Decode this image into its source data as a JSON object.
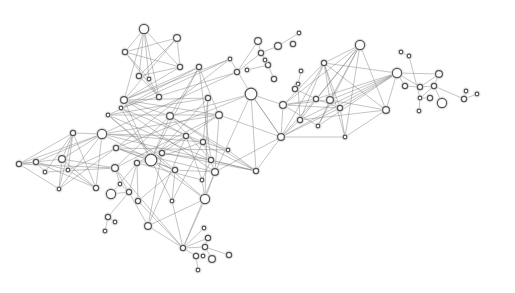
{
  "graph": {
    "type": "network",
    "colors": {
      "edge": "#7a7a7a",
      "node_fill": "#ffffff",
      "node_stroke": "#555555",
      "halo": "#d8d8d8"
    },
    "nodes": [
      {
        "id": "n1",
        "x": 144,
        "y": 29,
        "size": "large"
      },
      {
        "id": "n2",
        "x": 177,
        "y": 38,
        "size": "medium"
      },
      {
        "id": "n3",
        "x": 125,
        "y": 52,
        "size": "small"
      },
      {
        "id": "n4",
        "x": 180,
        "y": 67,
        "size": "small"
      },
      {
        "id": "n5",
        "x": 139,
        "y": 76,
        "size": "small"
      },
      {
        "id": "n6",
        "x": 149,
        "y": 79,
        "size": "tiny"
      },
      {
        "id": "n7",
        "x": 159,
        "y": 97,
        "size": "small"
      },
      {
        "id": "n8",
        "x": 124,
        "y": 100,
        "size": "medium"
      },
      {
        "id": "n9",
        "x": 199,
        "y": 67,
        "size": "small"
      },
      {
        "id": "n10",
        "x": 230,
        "y": 59,
        "size": "tiny"
      },
      {
        "id": "n11",
        "x": 237,
        "y": 72,
        "size": "small"
      },
      {
        "id": "n12",
        "x": 251,
        "y": 94,
        "size": "xlarge"
      },
      {
        "id": "n13",
        "x": 208,
        "y": 98,
        "size": "small"
      },
      {
        "id": "n14",
        "x": 170,
        "y": 116,
        "size": "medium"
      },
      {
        "id": "n15",
        "x": 219,
        "y": 115,
        "size": "medium"
      },
      {
        "id": "n16",
        "x": 121,
        "y": 108,
        "size": "tiny"
      },
      {
        "id": "n17",
        "x": 108,
        "y": 115,
        "size": "tiny"
      },
      {
        "id": "n18",
        "x": 102,
        "y": 134,
        "size": "large"
      },
      {
        "id": "n19",
        "x": 73,
        "y": 133,
        "size": "small"
      },
      {
        "id": "n20",
        "x": 19,
        "y": 164,
        "size": "small"
      },
      {
        "id": "n21",
        "x": 36,
        "y": 162,
        "size": "small"
      },
      {
        "id": "n22",
        "x": 62,
        "y": 159,
        "size": "medium"
      },
      {
        "id": "n23",
        "x": 68,
        "y": 170,
        "size": "tiny"
      },
      {
        "id": "n24",
        "x": 45,
        "y": 172,
        "size": "tiny"
      },
      {
        "id": "n25",
        "x": 59,
        "y": 189,
        "size": "tiny"
      },
      {
        "id": "n26",
        "x": 96,
        "y": 188,
        "size": "small"
      },
      {
        "id": "n27",
        "x": 115,
        "y": 168,
        "size": "medium"
      },
      {
        "id": "n28",
        "x": 116,
        "y": 148,
        "size": "small"
      },
      {
        "id": "n29",
        "x": 151,
        "y": 160,
        "size": "xlarge"
      },
      {
        "id": "n30",
        "x": 137,
        "y": 163,
        "size": "small"
      },
      {
        "id": "n31",
        "x": 162,
        "y": 153,
        "size": "small"
      },
      {
        "id": "n32",
        "x": 175,
        "y": 170,
        "size": "small"
      },
      {
        "id": "n33",
        "x": 186,
        "y": 136,
        "size": "small"
      },
      {
        "id": "n34",
        "x": 203,
        "y": 142,
        "size": "small"
      },
      {
        "id": "n35",
        "x": 211,
        "y": 160,
        "size": "small"
      },
      {
        "id": "n36",
        "x": 215,
        "y": 172,
        "size": "medium"
      },
      {
        "id": "n37",
        "x": 202,
        "y": 180,
        "size": "tiny"
      },
      {
        "id": "n38",
        "x": 228,
        "y": 150,
        "size": "tiny"
      },
      {
        "id": "n39",
        "x": 256,
        "y": 171,
        "size": "small"
      },
      {
        "id": "n40",
        "x": 205,
        "y": 199,
        "size": "large"
      },
      {
        "id": "n41",
        "x": 172,
        "y": 201,
        "size": "tiny"
      },
      {
        "id": "n42",
        "x": 138,
        "y": 201,
        "size": "small"
      },
      {
        "id": "n43",
        "x": 129,
        "y": 192,
        "size": "small"
      },
      {
        "id": "n44",
        "x": 120,
        "y": 184,
        "size": "tiny"
      },
      {
        "id": "n45",
        "x": 111,
        "y": 194,
        "size": "large"
      },
      {
        "id": "n46",
        "x": 108,
        "y": 217,
        "size": "small"
      },
      {
        "id": "n47",
        "x": 115,
        "y": 222,
        "size": "tiny"
      },
      {
        "id": "n48",
        "x": 105,
        "y": 231,
        "size": "tiny"
      },
      {
        "id": "n49",
        "x": 148,
        "y": 226,
        "size": "medium"
      },
      {
        "id": "n50",
        "x": 183,
        "y": 248,
        "size": "small"
      },
      {
        "id": "n51",
        "x": 204,
        "y": 228,
        "size": "tiny"
      },
      {
        "id": "n52",
        "x": 208,
        "y": 238,
        "size": "small"
      },
      {
        "id": "n53",
        "x": 205,
        "y": 247,
        "size": "small"
      },
      {
        "id": "n54",
        "x": 196,
        "y": 256,
        "size": "small"
      },
      {
        "id": "n55",
        "x": 203,
        "y": 256,
        "size": "tiny"
      },
      {
        "id": "n56",
        "x": 212,
        "y": 259,
        "size": "medium"
      },
      {
        "id": "n57",
        "x": 229,
        "y": 255,
        "size": "small"
      },
      {
        "id": "n58",
        "x": 198,
        "y": 270,
        "size": "tiny"
      },
      {
        "id": "n59",
        "x": 258,
        "y": 41,
        "size": "medium"
      },
      {
        "id": "n60",
        "x": 261,
        "y": 53,
        "size": "small"
      },
      {
        "id": "n61",
        "x": 278,
        "y": 46,
        "size": "medium"
      },
      {
        "id": "n62",
        "x": 299,
        "y": 33,
        "size": "tiny"
      },
      {
        "id": "n63",
        "x": 293,
        "y": 44,
        "size": "small"
      },
      {
        "id": "n64",
        "x": 268,
        "y": 65,
        "size": "small"
      },
      {
        "id": "n65",
        "x": 265,
        "y": 60,
        "size": "tiny"
      },
      {
        "id": "n66",
        "x": 274,
        "y": 79,
        "size": "small"
      },
      {
        "id": "n67",
        "x": 247,
        "y": 70,
        "size": "tiny"
      },
      {
        "id": "n68",
        "x": 301,
        "y": 71,
        "size": "tiny"
      },
      {
        "id": "n69",
        "x": 298,
        "y": 84,
        "size": "tiny"
      },
      {
        "id": "n70",
        "x": 295,
        "y": 89,
        "size": "small"
      },
      {
        "id": "n71",
        "x": 283,
        "y": 105,
        "size": "medium"
      },
      {
        "id": "n72",
        "x": 324,
        "y": 63,
        "size": "small"
      },
      {
        "id": "n73",
        "x": 360,
        "y": 45,
        "size": "large"
      },
      {
        "id": "n74",
        "x": 316,
        "y": 99,
        "size": "small"
      },
      {
        "id": "n75",
        "x": 330,
        "y": 100,
        "size": "medium"
      },
      {
        "id": "n76",
        "x": 340,
        "y": 108,
        "size": "small"
      },
      {
        "id": "n77",
        "x": 300,
        "y": 120,
        "size": "small"
      },
      {
        "id": "n78",
        "x": 318,
        "y": 126,
        "size": "tiny"
      },
      {
        "id": "n79",
        "x": 345,
        "y": 137,
        "size": "tiny"
      },
      {
        "id": "n80",
        "x": 281,
        "y": 137,
        "size": "medium"
      },
      {
        "id": "n81",
        "x": 386,
        "y": 110,
        "size": "medium"
      },
      {
        "id": "n82",
        "x": 397,
        "y": 73,
        "size": "large"
      },
      {
        "id": "n83",
        "x": 401,
        "y": 52,
        "size": "tiny"
      },
      {
        "id": "n84",
        "x": 409,
        "y": 56,
        "size": "tiny"
      },
      {
        "id": "n85",
        "x": 405,
        "y": 86,
        "size": "small"
      },
      {
        "id": "n86",
        "x": 420,
        "y": 87,
        "size": "small"
      },
      {
        "id": "n87",
        "x": 439,
        "y": 74,
        "size": "medium"
      },
      {
        "id": "n88",
        "x": 434,
        "y": 86,
        "size": "small"
      },
      {
        "id": "n89",
        "x": 420,
        "y": 98,
        "size": "tiny"
      },
      {
        "id": "n90",
        "x": 430,
        "y": 98,
        "size": "small"
      },
      {
        "id": "n91",
        "x": 442,
        "y": 103,
        "size": "large"
      },
      {
        "id": "n92",
        "x": 419,
        "y": 111,
        "size": "tiny"
      },
      {
        "id": "n93",
        "x": 464,
        "y": 99,
        "size": "small"
      },
      {
        "id": "n94",
        "x": 466,
        "y": 91,
        "size": "tiny"
      },
      {
        "id": "n95",
        "x": 477,
        "y": 94,
        "size": "tiny"
      }
    ],
    "edges": [
      [
        "n1",
        "n3"
      ],
      [
        "n1",
        "n5"
      ],
      [
        "n1",
        "n6"
      ],
      [
        "n1",
        "n7"
      ],
      [
        "n1",
        "n4"
      ],
      [
        "n1",
        "n8"
      ],
      [
        "n2",
        "n3"
      ],
      [
        "n2",
        "n5"
      ],
      [
        "n2",
        "n8"
      ],
      [
        "n2",
        "n4"
      ],
      [
        "n3",
        "n4"
      ],
      [
        "n3",
        "n7"
      ],
      [
        "n3",
        "n6"
      ],
      [
        "n4",
        "n8"
      ],
      [
        "n4",
        "n5"
      ],
      [
        "n5",
        "n7"
      ],
      [
        "n6",
        "n7"
      ],
      [
        "n8",
        "n9"
      ],
      [
        "n8",
        "n10"
      ],
      [
        "n8",
        "n13"
      ],
      [
        "n8",
        "n14"
      ],
      [
        "n8",
        "n29"
      ],
      [
        "n8",
        "n33"
      ],
      [
        "n8",
        "n15"
      ],
      [
        "n9",
        "n14"
      ],
      [
        "n9",
        "n16"
      ],
      [
        "n9",
        "n29"
      ],
      [
        "n9",
        "n35"
      ],
      [
        "n9",
        "n15"
      ],
      [
        "n10",
        "n12"
      ],
      [
        "n10",
        "n17"
      ],
      [
        "n10",
        "n28"
      ],
      [
        "n11",
        "n16"
      ],
      [
        "n11",
        "n59"
      ],
      [
        "n11",
        "n60"
      ],
      [
        "n11",
        "n18"
      ],
      [
        "n12",
        "n39"
      ],
      [
        "n12",
        "n14"
      ],
      [
        "n12",
        "n36"
      ],
      [
        "n12",
        "n80"
      ],
      [
        "n12",
        "n28"
      ],
      [
        "n13",
        "n29"
      ],
      [
        "n13",
        "n40"
      ],
      [
        "n13",
        "n17"
      ],
      [
        "n13",
        "n34"
      ],
      [
        "n14",
        "n29"
      ],
      [
        "n14",
        "n27"
      ],
      [
        "n14",
        "n35"
      ],
      [
        "n14",
        "n38"
      ],
      [
        "n15",
        "n27"
      ],
      [
        "n15",
        "n31"
      ],
      [
        "n15",
        "n36"
      ],
      [
        "n15",
        "n17"
      ],
      [
        "n15",
        "n18"
      ],
      [
        "n16",
        "n29"
      ],
      [
        "n16",
        "n36"
      ],
      [
        "n16",
        "n34"
      ],
      [
        "n17",
        "n32"
      ],
      [
        "n17",
        "n40"
      ],
      [
        "n17",
        "n35"
      ],
      [
        "n18",
        "n19"
      ],
      [
        "n18",
        "n20"
      ],
      [
        "n18",
        "n21"
      ],
      [
        "n18",
        "n22"
      ],
      [
        "n18",
        "n26"
      ],
      [
        "n18",
        "n25"
      ],
      [
        "n18",
        "n29"
      ],
      [
        "n18",
        "n33"
      ],
      [
        "n18",
        "n34"
      ],
      [
        "n18",
        "n39"
      ],
      [
        "n19",
        "n20"
      ],
      [
        "n19",
        "n22"
      ],
      [
        "n19",
        "n24"
      ],
      [
        "n19",
        "n25"
      ],
      [
        "n19",
        "n26"
      ],
      [
        "n19",
        "n23"
      ],
      [
        "n20",
        "n21"
      ],
      [
        "n20",
        "n22"
      ],
      [
        "n20",
        "n25"
      ],
      [
        "n20",
        "n27"
      ],
      [
        "n21",
        "n23"
      ],
      [
        "n21",
        "n24"
      ],
      [
        "n21",
        "n26"
      ],
      [
        "n22",
        "n25"
      ],
      [
        "n22",
        "n26"
      ],
      [
        "n22",
        "n27"
      ],
      [
        "n23",
        "n26"
      ],
      [
        "n23",
        "n28"
      ],
      [
        "n24",
        "n27"
      ],
      [
        "n25",
        "n28"
      ],
      [
        "n28",
        "n29"
      ],
      [
        "n28",
        "n32"
      ],
      [
        "n28",
        "n36"
      ],
      [
        "n28",
        "n38"
      ],
      [
        "n29",
        "n30"
      ],
      [
        "n29",
        "n31"
      ],
      [
        "n29",
        "n32"
      ],
      [
        "n29",
        "n34"
      ],
      [
        "n29",
        "n40"
      ],
      [
        "n29",
        "n41"
      ],
      [
        "n30",
        "n42"
      ],
      [
        "n30",
        "n33"
      ],
      [
        "n30",
        "n37"
      ],
      [
        "n31",
        "n35"
      ],
      [
        "n31",
        "n49"
      ],
      [
        "n31",
        "n39"
      ],
      [
        "n32",
        "n36"
      ],
      [
        "n32",
        "n42"
      ],
      [
        "n33",
        "n39"
      ],
      [
        "n33",
        "n49"
      ],
      [
        "n33",
        "n37"
      ],
      [
        "n34",
        "n36"
      ],
      [
        "n34",
        "n41"
      ],
      [
        "n35",
        "n37"
      ],
      [
        "n35",
        "n39"
      ],
      [
        "n36",
        "n40"
      ],
      [
        "n36",
        "n50"
      ],
      [
        "n37",
        "n40"
      ],
      [
        "n38",
        "n39"
      ],
      [
        "n40",
        "n49"
      ],
      [
        "n40",
        "n50"
      ],
      [
        "n41",
        "n50"
      ],
      [
        "n42",
        "n50"
      ],
      [
        "n43",
        "n44"
      ],
      [
        "n43",
        "n30"
      ],
      [
        "n44",
        "n27"
      ],
      [
        "n45",
        "n30"
      ],
      [
        "n45",
        "n43"
      ],
      [
        "n46",
        "n47"
      ],
      [
        "n46",
        "n48"
      ],
      [
        "n46",
        "n43"
      ],
      [
        "n49",
        "n50"
      ],
      [
        "n27",
        "n49"
      ],
      [
        "n27",
        "n50"
      ],
      [
        "n50",
        "n51"
      ],
      [
        "n50",
        "n52"
      ],
      [
        "n50",
        "n53"
      ],
      [
        "n50",
        "n54"
      ],
      [
        "n53",
        "n56"
      ],
      [
        "n53",
        "n57"
      ],
      [
        "n54",
        "n58"
      ],
      [
        "n54",
        "n55"
      ],
      [
        "n52",
        "n53"
      ],
      [
        "n59",
        "n60"
      ],
      [
        "n60",
        "n61"
      ],
      [
        "n61",
        "n62"
      ],
      [
        "n60",
        "n64"
      ],
      [
        "n60",
        "n65"
      ],
      [
        "n64",
        "n66"
      ],
      [
        "n64",
        "n67"
      ],
      [
        "n12",
        "n71"
      ],
      [
        "n12",
        "n80"
      ],
      [
        "n71",
        "n72"
      ],
      [
        "n71",
        "n73"
      ],
      [
        "n71",
        "n74"
      ],
      [
        "n71",
        "n75"
      ],
      [
        "n71",
        "n76"
      ],
      [
        "n71",
        "n78"
      ],
      [
        "n71",
        "n80"
      ],
      [
        "n70",
        "n74"
      ],
      [
        "n68",
        "n69"
      ],
      [
        "n69",
        "n77"
      ],
      [
        "n72",
        "n73"
      ],
      [
        "n72",
        "n75"
      ],
      [
        "n72",
        "n76"
      ],
      [
        "n72",
        "n77"
      ],
      [
        "n72",
        "n79"
      ],
      [
        "n72",
        "n81"
      ],
      [
        "n72",
        "n82"
      ],
      [
        "n73",
        "n74"
      ],
      [
        "n73",
        "n75"
      ],
      [
        "n73",
        "n77"
      ],
      [
        "n73",
        "n78"
      ],
      [
        "n73",
        "n79"
      ],
      [
        "n73",
        "n81"
      ],
      [
        "n74",
        "n76"
      ],
      [
        "n74",
        "n82"
      ],
      [
        "n75",
        "n78"
      ],
      [
        "n75",
        "n81"
      ],
      [
        "n75",
        "n82"
      ],
      [
        "n76",
        "n79"
      ],
      [
        "n76",
        "n82"
      ],
      [
        "n77",
        "n82"
      ],
      [
        "n77",
        "n81"
      ],
      [
        "n78",
        "n82"
      ],
      [
        "n79",
        "n81"
      ],
      [
        "n80",
        "n82"
      ],
      [
        "n80",
        "n77"
      ],
      [
        "n80",
        "n74"
      ],
      [
        "n80",
        "n72"
      ],
      [
        "n80",
        "n76"
      ],
      [
        "n80",
        "n79"
      ],
      [
        "n82",
        "n87"
      ],
      [
        "n82",
        "n86"
      ],
      [
        "n82",
        "n85"
      ],
      [
        "n82",
        "n81"
      ],
      [
        "n83",
        "n84"
      ],
      [
        "n84",
        "n89"
      ],
      [
        "n85",
        "n86"
      ],
      [
        "n86",
        "n87"
      ],
      [
        "n86",
        "n88"
      ],
      [
        "n87",
        "n88"
      ],
      [
        "n88",
        "n89"
      ],
      [
        "n88",
        "n91"
      ],
      [
        "n88",
        "n93"
      ],
      [
        "n89",
        "n90"
      ],
      [
        "n89",
        "n92"
      ],
      [
        "n93",
        "n94"
      ],
      [
        "n93",
        "n95"
      ],
      [
        "n39",
        "n80"
      ],
      [
        "n36",
        "n80"
      ],
      [
        "n15",
        "n80"
      ],
      [
        "n34",
        "n38"
      ],
      [
        "n32",
        "n41"
      ],
      [
        "n14",
        "n39"
      ]
    ]
  }
}
